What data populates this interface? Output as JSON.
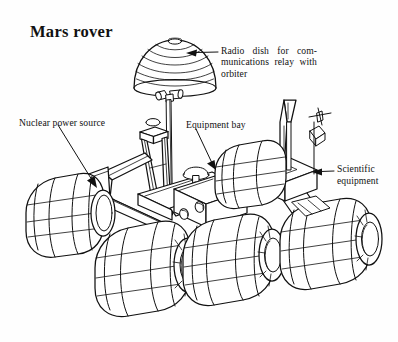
{
  "figure": {
    "title": "Mars rover",
    "kind": "line-art technical illustration",
    "background_color": "#fefefe",
    "ink_color": "#111111"
  },
  "labels": {
    "radio_dish": {
      "text": "Radio dish for com-munications relay with orbiter",
      "line1": "Radio dish for com-",
      "line2": "munications relay with",
      "line3": "orbiter"
    },
    "nuclear_power_source": {
      "text": "Nuclear power source"
    },
    "equipment_bay": {
      "text": "Equipment bay"
    },
    "scientific_equipment": {
      "text": "Scientific equipment",
      "line1": "Scientific",
      "line2": "equipment"
    }
  },
  "parts": [
    "radio-dish",
    "dish-pivot-joint",
    "dish-mast",
    "mast-tower",
    "nuclear-power-panel",
    "chassis",
    "equipment-bay-box",
    "equipment-bay-dome",
    "scientific-equipment-box",
    "antenna-horn",
    "instrument-arm",
    "wheel-front-left",
    "wheel-mid-left",
    "wheel-rear-left",
    "wheel-front-right",
    "wheel-mid-right",
    "wheel-rear-right"
  ]
}
